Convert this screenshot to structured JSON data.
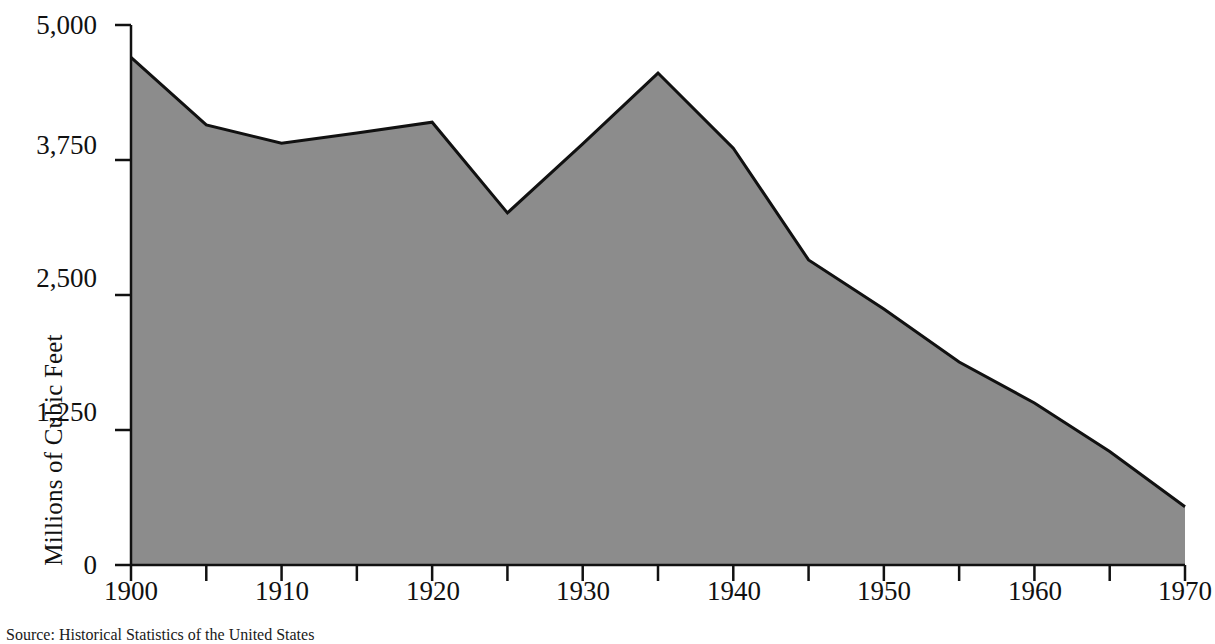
{
  "chart_data": {
    "type": "area",
    "title": "",
    "xlabel": "",
    "ylabel": "Millions of Cubic Feet",
    "x": [
      1900,
      1905,
      1910,
      1915,
      1920,
      1925,
      1930,
      1935,
      1940,
      1945,
      1950,
      1955,
      1960,
      1965,
      1970
    ],
    "values": [
      4700,
      4075,
      3905,
      4000,
      4100,
      3260,
      3900,
      4555,
      3860,
      2825,
      2370,
      1880,
      1500,
      1050,
      540
    ],
    "series": [
      {
        "name": "Lumber Production",
        "values": [
          4700,
          4075,
          3905,
          4000,
          4100,
          3260,
          3900,
          4555,
          3860,
          2825,
          2370,
          1880,
          1500,
          1050,
          540
        ]
      }
    ],
    "xlim": [
      1900,
      1970
    ],
    "ylim": [
      0,
      5000
    ],
    "y_ticks": [
      0,
      1250,
      2500,
      3750,
      5000
    ],
    "y_tick_labels": [
      "0",
      "1,250",
      "2,500",
      "3,750",
      "5,000"
    ],
    "x_ticks": [
      1900,
      1905,
      1910,
      1915,
      1920,
      1925,
      1930,
      1935,
      1940,
      1945,
      1950,
      1955,
      1960,
      1965,
      1970
    ],
    "x_tick_labels_major": [
      "1900",
      "1910",
      "1920",
      "1930",
      "1940",
      "1950",
      "1960",
      "1970"
    ],
    "x_major_positions": [
      1900,
      1910,
      1920,
      1930,
      1940,
      1950,
      1960,
      1970
    ],
    "grid": false,
    "legend": "none",
    "fill_color": "#8c8c8c",
    "line_color": "#111111",
    "axis_color": "#111111",
    "background_color": "#ffffff"
  },
  "axis": {
    "y_title": "Millions of Cubic Feet",
    "y_tick_labels": [
      "5,000",
      "3,750",
      "2,500",
      "1,250",
      "0"
    ],
    "x_tick_labels": [
      "1900",
      "1910",
      "1920",
      "1930",
      "1940",
      "1950",
      "1960",
      "1970"
    ]
  },
  "footer": {
    "source_note": "Source:  Historical Statistics of the United States"
  }
}
